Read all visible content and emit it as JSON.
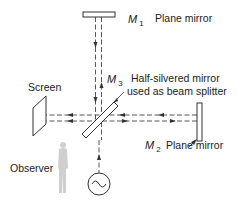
{
  "diagram": {
    "components": {
      "m1": {
        "symbol": "M",
        "subscript": "1",
        "description": "Plane mirror"
      },
      "m2": {
        "symbol": "M",
        "subscript": "2",
        "description": "Plane mirror"
      },
      "m3": {
        "symbol": "M",
        "subscript": "3",
        "description_line1": "Half-silvered mirror",
        "description_line2": "used as beam splitter"
      },
      "screen": {
        "label": "Screen"
      },
      "observer": {
        "label": "Observer"
      },
      "source": {
        "label": "",
        "icon": "ac-source-icon"
      }
    },
    "colors": {
      "line": "#333333",
      "observer_fill": "#cfcfcf"
    }
  }
}
